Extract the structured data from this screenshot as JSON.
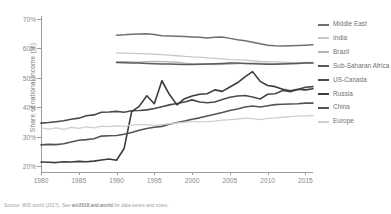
{
  "chart_data": {
    "type": "line",
    "title": "",
    "xlabel": "",
    "ylabel": "Share of national income (%)",
    "xlim": [
      1980,
      2016
    ],
    "ylim": [
      18,
      71
    ],
    "xticks": [
      "1980",
      "1985",
      "1990",
      "1995",
      "2000",
      "2005",
      "2010",
      "2015"
    ],
    "yticks": [
      "20%",
      "30%",
      "40%",
      "50%",
      "60%",
      "70%"
    ],
    "grid": false,
    "legend_position": "right",
    "series": [
      {
        "name": "Middle East",
        "color": "#6f6f6f",
        "width": 1.5,
        "x": [
          1990,
          1991,
          1992,
          1993,
          1994,
          1995,
          1996,
          1997,
          1998,
          1999,
          2000,
          2001,
          2002,
          2003,
          2004,
          2005,
          2006,
          2007,
          2008,
          2009,
          2010,
          2011,
          2012,
          2013,
          2014,
          2015,
          2016
        ],
        "values": [
          64.5,
          64.6,
          64.8,
          64.9,
          65.0,
          64.7,
          64.3,
          64.2,
          64.1,
          64.0,
          63.9,
          63.8,
          63.5,
          63.8,
          63.9,
          63.4,
          62.9,
          62.6,
          62.1,
          61.6,
          61.1,
          60.9,
          60.8,
          60.9,
          61.0,
          61.1,
          61.2
        ]
      },
      {
        "name": "India",
        "color": "#c8c8c8",
        "width": 1.3,
        "x": [
          1990,
          1991,
          1992,
          1993,
          1994,
          1995,
          1996,
          1997,
          1998,
          1999,
          2000,
          2001,
          2002,
          2003,
          2004,
          2005,
          2006,
          2007,
          2008,
          2009,
          2010,
          2011,
          2012,
          2013,
          2014,
          2015,
          2016
        ],
        "values": [
          58.5,
          58.4,
          58.3,
          58.2,
          58.1,
          58.0,
          57.9,
          57.7,
          57.5,
          57.3,
          57.1,
          57.0,
          56.8,
          56.6,
          56.4,
          56.2,
          56.1,
          56.0,
          55.8,
          55.6,
          55.5,
          55.4,
          55.3,
          55.2,
          55.1,
          55.0,
          55.0
        ]
      },
      {
        "name": "Brazil",
        "color": "#b4b4b4",
        "width": 1.3,
        "x": [
          1990,
          1991,
          1992,
          1993,
          1994,
          1995,
          1996,
          1997,
          1998,
          1999,
          2000,
          2001,
          2002,
          2003,
          2004,
          2005,
          2006,
          2007,
          2008,
          2009,
          2010,
          2011,
          2012,
          2013,
          2014,
          2015,
          2016
        ],
        "values": [
          55.4,
          55.5,
          55.4,
          55.3,
          55.5,
          55.6,
          55.5,
          55.4,
          55.3,
          55.0,
          54.8,
          54.7,
          54.6,
          54.5,
          54.6,
          54.7,
          54.8,
          54.9,
          55.0,
          55.0,
          54.9,
          54.8,
          54.9,
          55.0,
          55.1,
          55.2,
          55.2
        ]
      },
      {
        "name": "Sub-Saharan Africa",
        "color": "#5a5a5a",
        "width": 1.5,
        "x": [
          1990,
          1991,
          1992,
          1993,
          1994,
          1995,
          1996,
          1997,
          1998,
          1999,
          2000,
          2001,
          2002,
          2003,
          2004,
          2005,
          2006,
          2007,
          2008,
          2009,
          2010,
          2011,
          2012,
          2013,
          2014,
          2015,
          2016
        ],
        "values": [
          55.2,
          55.1,
          55.0,
          55.0,
          54.9,
          54.8,
          54.7,
          54.7,
          54.6,
          54.5,
          54.5,
          54.6,
          54.7,
          54.8,
          54.9,
          55.0,
          55.0,
          54.9,
          54.8,
          54.7,
          54.6,
          54.6,
          54.7,
          54.8,
          54.9,
          55.0,
          55.0
        ]
      },
      {
        "name": "US-Canada",
        "color": "#4a4a4a",
        "width": 1.6,
        "x": [
          1980,
          1981,
          1982,
          1983,
          1984,
          1985,
          1986,
          1987,
          1988,
          1989,
          1990,
          1991,
          1992,
          1993,
          1994,
          1995,
          1996,
          1997,
          1998,
          1999,
          2000,
          2001,
          2002,
          2003,
          2004,
          2005,
          2006,
          2007,
          2008,
          2009,
          2010,
          2011,
          2012,
          2013,
          2014,
          2015,
          2016
        ],
        "values": [
          34.6,
          34.8,
          35.1,
          35.4,
          35.9,
          36.3,
          37.1,
          37.4,
          38.3,
          38.4,
          38.6,
          38.3,
          38.8,
          38.9,
          39.1,
          39.6,
          40.2,
          40.8,
          41.3,
          41.8,
          42.5,
          41.8,
          41.5,
          41.8,
          42.6,
          43.4,
          43.8,
          44.0,
          43.5,
          42.8,
          44.4,
          44.6,
          45.7,
          45.3,
          46.0,
          46.8,
          47.0
        ]
      },
      {
        "name": "Russia",
        "color": "#3c3c3c",
        "width": 1.6,
        "x": [
          1980,
          1981,
          1982,
          1983,
          1984,
          1985,
          1986,
          1987,
          1988,
          1989,
          1990,
          1991,
          1992,
          1993,
          1994,
          1995,
          1996,
          1997,
          1998,
          1999,
          2000,
          2001,
          2002,
          2003,
          2004,
          2005,
          2006,
          2007,
          2008,
          2009,
          2010,
          2011,
          2012,
          2013,
          2014,
          2015,
          2016
        ],
        "values": [
          21.4,
          21.3,
          21.2,
          21.5,
          21.4,
          21.6,
          21.5,
          21.7,
          22.1,
          22.4,
          22.0,
          26.0,
          38.5,
          40.3,
          43.9,
          41.2,
          49.0,
          44.3,
          40.8,
          42.9,
          43.8,
          44.4,
          44.6,
          45.9,
          45.4,
          46.9,
          48.3,
          50.3,
          52.1,
          48.8,
          47.4,
          47.0,
          46.1,
          45.6,
          46.1,
          45.9,
          46.3
        ]
      },
      {
        "name": "China",
        "color": "#545454",
        "width": 1.6,
        "x": [
          1980,
          1981,
          1982,
          1983,
          1984,
          1985,
          1986,
          1987,
          1988,
          1989,
          1990,
          1991,
          1992,
          1993,
          1994,
          1995,
          1996,
          1997,
          1998,
          1999,
          2000,
          2001,
          2002,
          2003,
          2004,
          2005,
          2006,
          2007,
          2008,
          2009,
          2010,
          2011,
          2012,
          2013,
          2014,
          2015,
          2016
        ],
        "values": [
          27.2,
          27.4,
          27.3,
          27.6,
          28.2,
          28.8,
          29.0,
          29.3,
          30.2,
          30.3,
          30.4,
          30.8,
          31.4,
          32.2,
          32.8,
          33.2,
          33.5,
          34.2,
          34.8,
          35.3,
          35.9,
          36.4,
          37.0,
          37.6,
          38.2,
          38.9,
          39.4,
          40.1,
          40.4,
          40.1,
          40.5,
          40.9,
          41.0,
          41.1,
          41.2,
          41.4,
          41.4
        ]
      },
      {
        "name": "Europe",
        "color": "#cfcfcf",
        "width": 1.3,
        "x": [
          1980,
          1981,
          1982,
          1983,
          1984,
          1985,
          1986,
          1987,
          1988,
          1989,
          1990,
          1991,
          1992,
          1993,
          1994,
          1995,
          1996,
          1997,
          1998,
          1999,
          2000,
          2001,
          2002,
          2003,
          2004,
          2005,
          2006,
          2007,
          2008,
          2009,
          2010,
          2011,
          2012,
          2013,
          2014,
          2015,
          2016
        ],
        "values": [
          33.1,
          32.6,
          33.0,
          32.5,
          33.2,
          32.8,
          33.3,
          33.0,
          33.6,
          33.4,
          33.7,
          33.5,
          33.9,
          34.2,
          34.0,
          33.8,
          34.1,
          34.4,
          34.7,
          34.9,
          35.2,
          35.0,
          35.1,
          35.3,
          35.6,
          35.8,
          36.0,
          36.3,
          36.1,
          35.8,
          36.2,
          36.4,
          36.6,
          36.8,
          37.0,
          37.1,
          37.2
        ]
      }
    ]
  },
  "legend": {
    "items": [
      {
        "label": "Middle East",
        "color": "#6f6f6f"
      },
      {
        "label": "India",
        "color": "#c8c8c8"
      },
      {
        "label": "Brazil",
        "color": "#b4b4b4"
      },
      {
        "label": "Sub-Saharan Africa",
        "color": "#5a5a5a"
      },
      {
        "label": "US-Canada",
        "color": "#4a4a4a"
      },
      {
        "label": "Russia",
        "color": "#3c3c3c"
      },
      {
        "label": "China",
        "color": "#545454"
      },
      {
        "label": "Europe",
        "color": "#cfcfcf"
      }
    ]
  },
  "source": {
    "prefix": "Source: WID.world (2017). See ",
    "link": "wir2018.wid.world",
    "suffix": " for data series and notes."
  }
}
